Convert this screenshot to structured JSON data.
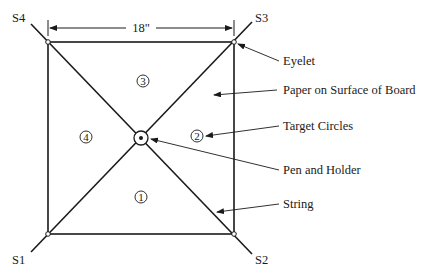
{
  "diagram": {
    "dimension": "18\"",
    "corners": {
      "s1": "S1",
      "s2": "S2",
      "s3": "S3",
      "s4": "S4"
    },
    "targets": {
      "t1": "1",
      "t2": "2",
      "t3": "3",
      "t4": "4"
    },
    "callouts": {
      "eyelet": "Eyelet",
      "paper": "Paper on Surface of Board",
      "target": "Target Circles",
      "pen": "Pen and Holder",
      "string": "String"
    }
  }
}
